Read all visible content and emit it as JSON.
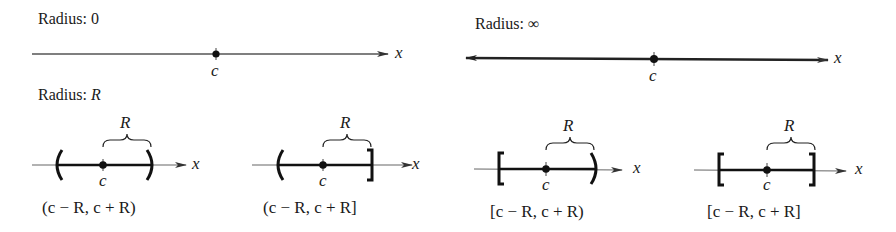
{
  "panels": {
    "radius_zero": {
      "label_prefix": "Radius: ",
      "label_value": "0",
      "center_label": "c",
      "axis_label": "x"
    },
    "radius_infinity": {
      "label_prefix": "Radius: ",
      "label_value": "∞",
      "center_label": "c",
      "axis_label": "x"
    },
    "radius_r": {
      "label_prefix": "Radius: ",
      "label_value": "R",
      "diagrams": [
        {
          "radius_label": "R",
          "center_label": "c",
          "axis_label": "x",
          "left_end": "(",
          "right_end": ")",
          "interval": "(c − R,  c + R)"
        },
        {
          "radius_label": "R",
          "center_label": "c",
          "axis_label": "x",
          "left_end": "(",
          "right_end": "]",
          "interval": "(c − R,  c + R]"
        },
        {
          "radius_label": "R",
          "center_label": "c",
          "axis_label": "x",
          "left_end": "[",
          "right_end": ")",
          "interval": "[c − R,  c + R)"
        },
        {
          "radius_label": "R",
          "center_label": "c",
          "axis_label": "x",
          "left_end": "[",
          "right_end": "]",
          "interval": "[c − R,  c + R]"
        }
      ]
    }
  },
  "colors": {
    "ink": "#1a1a1a",
    "axis": "#555555",
    "background": "#ffffff"
  }
}
